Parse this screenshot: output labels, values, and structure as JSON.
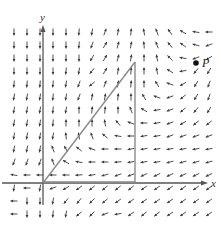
{
  "figure": {
    "axes": {
      "x_label": "x",
      "y_label": "y"
    },
    "point": {
      "label": "P"
    },
    "caption": "",
    "colors": {
      "arrow": "#3a3a3a",
      "axis": "#555555",
      "triangle": "#8a8a8a",
      "point": "#111111"
    },
    "shapes": [
      {
        "type": "right-triangle",
        "vertices": [
          [
            0,
            0
          ],
          [
            7,
            9.3
          ],
          [
            7,
            0
          ]
        ],
        "description": "triangle with hypotenuse from origin, vertical leg and base on x-axis"
      }
    ],
    "point_coords": [
      11.8,
      9.3
    ],
    "vector_field": {
      "description": "direction field sampled on a regular grid; angles in degrees (0 = +x, 90 = +y)",
      "x_range": [
        -2,
        13
      ],
      "y_range": [
        -2,
        12
      ],
      "angles_by_row_top_to_bottom": [
        [
          -90,
          -90,
          -90,
          -90,
          -90,
          -95,
          -100,
          70,
          80,
          85,
          100,
          110,
          125,
          150,
          170,
          180
        ],
        [
          -90,
          -90,
          -90,
          -90,
          -90,
          -95,
          -110,
          60,
          75,
          80,
          95,
          110,
          130,
          145,
          165,
          200
        ],
        [
          -90,
          -90,
          -90,
          -90,
          -90,
          -90,
          -120,
          60,
          75,
          80,
          90,
          100,
          135,
          170,
          200,
          210
        ],
        [
          -90,
          -90,
          -90,
          -90,
          -95,
          -100,
          -130,
          60,
          80,
          85,
          90,
          100,
          150,
          190,
          230,
          240
        ],
        [
          -95,
          -95,
          -95,
          -95,
          -100,
          -110,
          -140,
          70,
          80,
          85,
          90,
          120,
          160,
          210,
          240,
          250
        ],
        [
          -100,
          -100,
          -100,
          -95,
          -100,
          -110,
          80,
          80,
          85,
          90,
          120,
          160,
          200,
          220,
          240,
          250
        ],
        [
          -100,
          -100,
          -100,
          -95,
          -100,
          90,
          85,
          85,
          90,
          110,
          150,
          190,
          200,
          220,
          230,
          240
        ],
        [
          -100,
          -100,
          -100,
          -95,
          90,
          90,
          90,
          100,
          130,
          160,
          180,
          190,
          200,
          210,
          220,
          220
        ],
        [
          -100,
          -100,
          -100,
          -100,
          95,
          100,
          110,
          140,
          170,
          180,
          190,
          190,
          200,
          200,
          200,
          200
        ],
        [
          -100,
          -100,
          -100,
          110,
          120,
          140,
          160,
          180,
          180,
          190,
          190,
          190,
          190,
          190,
          190,
          190
        ],
        [
          -110,
          -110,
          -110,
          110,
          150,
          170,
          180,
          180,
          185,
          190,
          190,
          190,
          195,
          195,
          195,
          195
        ],
        [
          170,
          180,
          180,
          180,
          180,
          185,
          190,
          195,
          200,
          200,
          205,
          205,
          205,
          205,
          205,
          205
        ],
        [
          -100,
          180,
          -100,
          200,
          210,
          215,
          220,
          220,
          220,
          220,
          215,
          215,
          215,
          215,
          215,
          215
        ],
        [
          180,
          -90,
          -90,
          -100,
          230,
          230,
          225,
          220,
          215,
          215,
          215,
          215,
          215,
          215,
          215,
          215
        ],
        [
          180,
          -90,
          -90,
          -95,
          -100,
          220,
          225,
          200,
          190,
          215,
          220,
          220,
          215,
          215,
          215,
          215
        ]
      ]
    }
  }
}
